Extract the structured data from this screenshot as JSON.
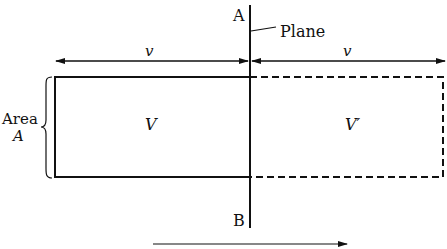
{
  "diagram": {
    "plane_label": "Plane",
    "point_top": "A",
    "point_bottom": "B",
    "left_velocity_label": "v",
    "right_velocity_label": "v",
    "left_volume_label": "V",
    "right_volume_label": "V′",
    "area_label_line1": "Area",
    "area_label_line2": "A",
    "bottom_arrow_caption": "Direction of motion (cut off)"
  },
  "colors": {
    "stroke": "#111111",
    "background": "#ffffff"
  }
}
